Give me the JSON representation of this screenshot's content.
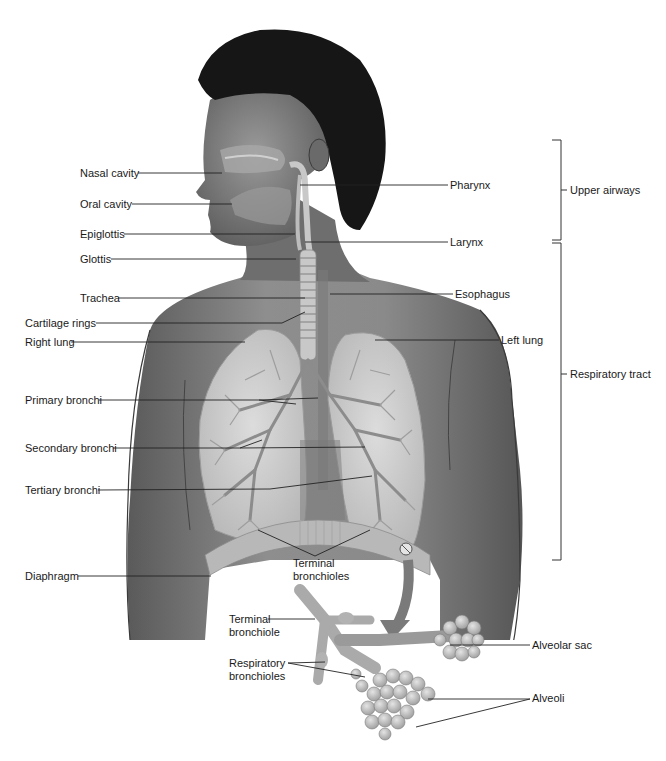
{
  "diagram": {
    "left_labels": [
      {
        "id": "nasal-cavity",
        "text": "Nasal cavity",
        "x": 80,
        "y": 167
      },
      {
        "id": "oral-cavity",
        "text": "Oral cavity",
        "x": 80,
        "y": 198
      },
      {
        "id": "epiglottis",
        "text": "Epiglottis",
        "x": 80,
        "y": 228
      },
      {
        "id": "glottis",
        "text": "Glottis",
        "x": 80,
        "y": 253
      },
      {
        "id": "trachea",
        "text": "Trachea",
        "x": 80,
        "y": 292
      },
      {
        "id": "cartilage-rings",
        "text": "Cartilage rings",
        "x": 25,
        "y": 317
      },
      {
        "id": "right-lung",
        "text": "Right lung",
        "x": 25,
        "y": 336
      },
      {
        "id": "primary-bronchi",
        "text": "Primary bronchi",
        "x": 25,
        "y": 394
      },
      {
        "id": "secondary-bronchi",
        "text": "Secondary bronchi",
        "x": 25,
        "y": 442
      },
      {
        "id": "tertiary-bronchi",
        "text": "Tertiary bronchi",
        "x": 25,
        "y": 484
      },
      {
        "id": "diaphragm",
        "text": "Diaphragm",
        "x": 25,
        "y": 570
      }
    ],
    "right_labels": [
      {
        "id": "pharynx",
        "text": "Pharynx",
        "x": 450,
        "y": 179
      },
      {
        "id": "larynx",
        "text": "Larynx",
        "x": 450,
        "y": 236
      },
      {
        "id": "esophagus",
        "text": "Esophagus",
        "x": 455,
        "y": 288
      },
      {
        "id": "left-lung",
        "text": "Left lung",
        "x": 501,
        "y": 334
      }
    ],
    "center_labels": [
      {
        "id": "terminal-bronchioles",
        "text": "Terminal bronchioles",
        "x": 293,
        "y": 557
      },
      {
        "id": "terminal-bronchiole",
        "text": "Terminal bronchiole",
        "x": 229,
        "y": 614
      },
      {
        "id": "respiratory-bronchioles",
        "text": "Respiratory bronchioles",
        "x": 229,
        "y": 659
      }
    ],
    "detail_labels": [
      {
        "id": "alveolar-sac",
        "text": "Alveolar sac",
        "x": 532,
        "y": 639
      },
      {
        "id": "alveoli",
        "text": "Alveoli",
        "x": 532,
        "y": 692
      }
    ],
    "brackets": [
      {
        "id": "upper-airways",
        "text": "Upper airways",
        "top": 140,
        "bottom": 240,
        "x": 561,
        "label_x": 570,
        "label_y": 186
      },
      {
        "id": "respiratory-tract",
        "text": "Respiratory tract",
        "top": 243,
        "bottom": 560,
        "x": 561,
        "label_x": 570,
        "label_y": 369
      }
    ],
    "colors": {
      "skin_dark": "#4a4a4a",
      "skin_mid": "#8a8a8a",
      "skin_light": "#b5b5b5",
      "hair": "#141414",
      "lung": "#cfcfcf",
      "bronchi": "#8c8c8c",
      "leader_line": "#222222",
      "background": "#ffffff"
    }
  }
}
